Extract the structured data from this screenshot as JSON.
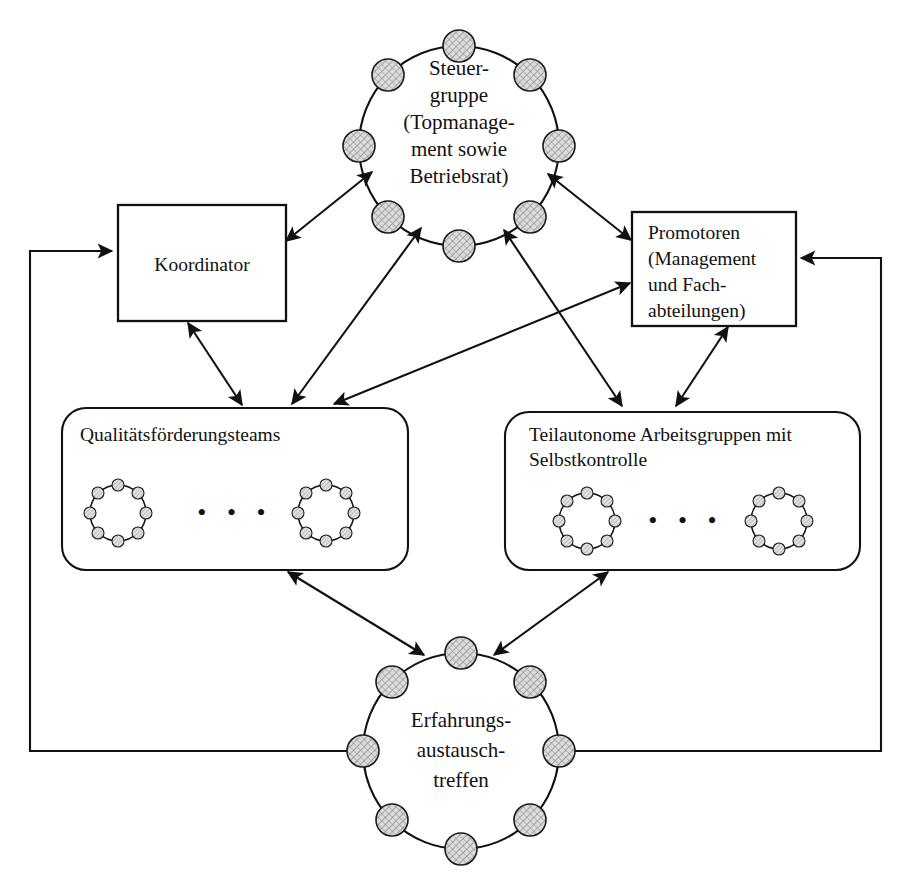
{
  "diagram": {
    "language": "de",
    "background_color": "#ffffff",
    "line_color": "#111111",
    "node_fill_color": "#d8d8d8"
  },
  "nodes": {
    "steuergruppe": {
      "id": "steuergruppe",
      "shape": "circle-of-members",
      "member_count": 8,
      "lines": [
        "Steuer-",
        "gruppe",
        "(Topmanage-",
        "ment sowie",
        "Betriebsrat)"
      ],
      "text": "Steuer-gruppe (Topmanagement sowie Betriebsrat)"
    },
    "koordinator": {
      "id": "koordinator",
      "shape": "rectangle",
      "lines": [
        "Koordinator"
      ],
      "text": "Koordinator"
    },
    "promotoren": {
      "id": "promotoren",
      "shape": "rectangle",
      "lines": [
        "Promotoren",
        "(Management",
        "und Fach-",
        "abteilungen)"
      ],
      "text": "Promotoren (Management und Fachabteilungen)"
    },
    "qualitaetsfoerderungsteams": {
      "id": "qualitaetsfoerderungsteams",
      "shape": "rounded-rectangle",
      "lines": [
        "Qualitätsförderungsteams"
      ],
      "text": "Qualitätsförderungsteams",
      "inner_groups": 2,
      "inner_group_member_count": 8,
      "ellipsis": "• • •"
    },
    "teilautonome_arbeitsgruppen": {
      "id": "teilautonome_arbeitsgruppen",
      "shape": "rounded-rectangle",
      "lines": [
        "Teilautonome Arbeitsgruppen mit",
        "Selbstkontrolle"
      ],
      "text": "Teilautonome Arbeitsgruppen mit Selbstkontrolle",
      "inner_groups": 2,
      "inner_group_member_count": 8,
      "ellipsis": "• • •"
    },
    "erfahrungsaustauschtreffen": {
      "id": "erfahrungsaustauschtreffen",
      "shape": "circle-of-members",
      "member_count": 8,
      "lines": [
        "Erfahrungs-",
        "austausch-",
        "treffen"
      ],
      "text": "Erfahrungsaustauschtreffen"
    }
  },
  "edges": [
    {
      "from": "koordinator",
      "to": "steuergruppe",
      "arrows": "both"
    },
    {
      "from": "steuergruppe",
      "to": "promotoren",
      "arrows": "both"
    },
    {
      "from": "steuergruppe",
      "to": "qualitaetsfoerderungsteams",
      "arrows": "both"
    },
    {
      "from": "steuergruppe",
      "to": "teilautonome_arbeitsgruppen",
      "arrows": "both"
    },
    {
      "from": "koordinator",
      "to": "qualitaetsfoerderungsteams",
      "arrows": "both"
    },
    {
      "from": "promotoren",
      "to": "qualitaetsfoerderungsteams",
      "arrows": "both"
    },
    {
      "from": "promotoren",
      "to": "teilautonome_arbeitsgruppen",
      "arrows": "both"
    },
    {
      "from": "qualitaetsfoerderungsteams",
      "to": "erfahrungsaustauschtreffen",
      "arrows": "both"
    },
    {
      "from": "teilautonome_arbeitsgruppen",
      "to": "erfahrungsaustauschtreffen",
      "arrows": "both"
    },
    {
      "from": "erfahrungsaustauschtreffen",
      "to": "koordinator",
      "arrows": "single",
      "routing": "left-loop"
    },
    {
      "from": "erfahrungsaustauschtreffen",
      "to": "promotoren",
      "arrows": "single",
      "routing": "right-loop"
    }
  ]
}
